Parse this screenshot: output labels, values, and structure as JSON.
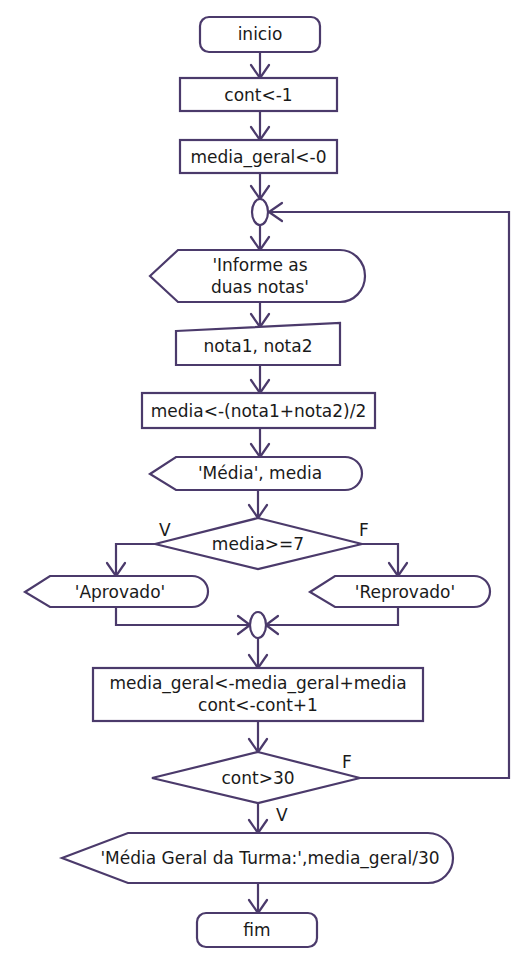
{
  "diagram": {
    "type": "flowchart",
    "stroke_color": "#4b3a6b",
    "nodes": {
      "start": {
        "shape": "terminator",
        "label": "inicio"
      },
      "init_cont": {
        "shape": "process",
        "label": "cont<-1"
      },
      "init_media_geral": {
        "shape": "process",
        "label": "media_geral<-0"
      },
      "loop_connector": {
        "shape": "connector",
        "label": ""
      },
      "prompt": {
        "shape": "display",
        "label": "'Informe as\nduas notas'"
      },
      "read_notas": {
        "shape": "manual-input",
        "label": "nota1, nota2"
      },
      "calc_media": {
        "shape": "process",
        "label": "media<-(nota1+nota2)/2"
      },
      "show_media": {
        "shape": "display",
        "label": "'Média', media"
      },
      "decision_media": {
        "shape": "decision",
        "label": "media>=7"
      },
      "aprovado": {
        "shape": "display",
        "label": "'Aprovado'"
      },
      "reprovado": {
        "shape": "display",
        "label": "'Reprovado'"
      },
      "merge_connector": {
        "shape": "connector",
        "label": ""
      },
      "accumulate": {
        "shape": "process",
        "label": "media_geral<-media_geral+media\ncont<-cont+1"
      },
      "decision_cont": {
        "shape": "decision",
        "label": "cont>30"
      },
      "show_geral": {
        "shape": "display",
        "label": "'Média Geral da Turma:',media_geral/30"
      },
      "end": {
        "shape": "terminator",
        "label": "fim"
      }
    },
    "edge_labels": {
      "media_true": "V",
      "media_false": "F",
      "cont_false": "F",
      "cont_true": "V"
    },
    "edges": [
      {
        "from": "start",
        "to": "init_cont"
      },
      {
        "from": "init_cont",
        "to": "init_media_geral"
      },
      {
        "from": "init_media_geral",
        "to": "loop_connector"
      },
      {
        "from": "loop_connector",
        "to": "prompt"
      },
      {
        "from": "prompt",
        "to": "read_notas"
      },
      {
        "from": "read_notas",
        "to": "calc_media"
      },
      {
        "from": "calc_media",
        "to": "show_media"
      },
      {
        "from": "show_media",
        "to": "decision_media"
      },
      {
        "from": "decision_media",
        "to": "aprovado",
        "label": "V"
      },
      {
        "from": "decision_media",
        "to": "reprovado",
        "label": "F"
      },
      {
        "from": "aprovado",
        "to": "merge_connector"
      },
      {
        "from": "reprovado",
        "to": "merge_connector"
      },
      {
        "from": "merge_connector",
        "to": "accumulate"
      },
      {
        "from": "accumulate",
        "to": "decision_cont"
      },
      {
        "from": "decision_cont",
        "to": "loop_connector",
        "label": "F"
      },
      {
        "from": "decision_cont",
        "to": "show_geral",
        "label": "V"
      },
      {
        "from": "show_geral",
        "to": "end"
      }
    ]
  }
}
